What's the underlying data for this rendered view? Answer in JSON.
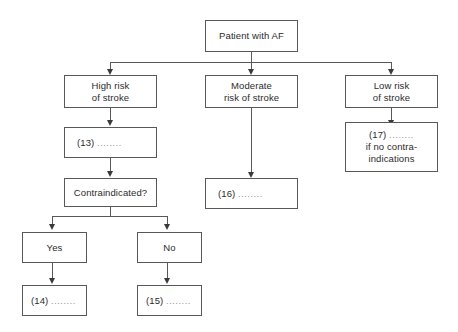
{
  "diagram": {
    "colors": {
      "background": "#ffffff",
      "box_border": "#58585a",
      "text": "#2b2b2b",
      "dots": "#8d8d8f",
      "connector": "#58585a",
      "arrowhead": "#3a3a3c"
    }
  },
  "nodes": {
    "root": {
      "label": "Patient with AF"
    },
    "high_risk": {
      "line1": "High risk",
      "line2": "of stroke"
    },
    "moderate_risk": {
      "line1": "Moderate",
      "line2": "risk of stroke"
    },
    "low_risk": {
      "line1": "Low risk",
      "line2": "of stroke"
    },
    "blank_13": {
      "number": "(13)",
      "dots": "........"
    },
    "blank_17": {
      "number": "(17)",
      "dots": "........",
      "line2": "if no contra-",
      "line3": "indications"
    },
    "contraindicated": {
      "label": "Contraindicated?"
    },
    "blank_16": {
      "number": "(16)",
      "dots": "........"
    },
    "yes": {
      "label": "Yes"
    },
    "no": {
      "label": "No"
    },
    "blank_14": {
      "number": "(14)",
      "dots": "........"
    },
    "blank_15": {
      "number": "(15)",
      "dots": "........"
    }
  },
  "edges": [
    {
      "name": "root-to-split",
      "from": "root",
      "to": "distribution-bus"
    },
    {
      "name": "split-to-high-risk",
      "from": "distribution-bus",
      "to": "high_risk"
    },
    {
      "name": "split-to-moderate-risk",
      "from": "distribution-bus",
      "to": "moderate_risk"
    },
    {
      "name": "split-to-low-risk",
      "from": "distribution-bus",
      "to": "low_risk"
    },
    {
      "name": "high-risk-to-13",
      "from": "high_risk",
      "to": "blank_13"
    },
    {
      "name": "13-to-contraindicated",
      "from": "blank_13",
      "to": "contraindicated"
    },
    {
      "name": "contraindicated-to-yes",
      "from": "contraindicated",
      "to": "yes"
    },
    {
      "name": "contraindicated-to-no",
      "from": "contraindicated",
      "to": "no"
    },
    {
      "name": "yes-to-14",
      "from": "yes",
      "to": "blank_14"
    },
    {
      "name": "no-to-15",
      "from": "no",
      "to": "blank_15"
    },
    {
      "name": "moderate-risk-to-16",
      "from": "moderate_risk",
      "to": "blank_16"
    },
    {
      "name": "low-risk-to-17",
      "from": "low_risk",
      "to": "blank_17"
    }
  ]
}
